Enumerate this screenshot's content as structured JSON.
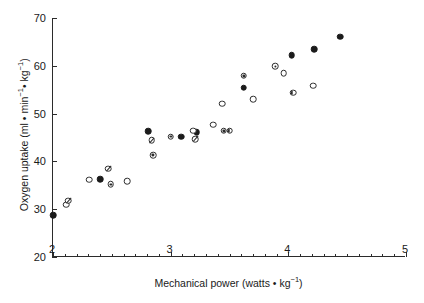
{
  "chart_data": {
    "type": "scatter",
    "title": "",
    "xlabel": "Mechanical power (watts • kg⁻¹)",
    "ylabel": "Oxygen uptake (ml • min⁻¹• kg⁻¹)",
    "xlim": [
      2,
      5
    ],
    "ylim": [
      20,
      70
    ],
    "x_major_ticks": [
      2,
      3,
      4,
      5
    ],
    "x_major_tick_labels": [
      "2",
      "3",
      "4",
      "5"
    ],
    "x_minor_tick_step": 0.1,
    "y_major_ticks": [
      20,
      30,
      40,
      50,
      60,
      70
    ],
    "y_major_tick_labels": [
      "20",
      "30",
      "40",
      "50",
      "60",
      "70"
    ],
    "grid": false,
    "legend": null,
    "marker_colors": {
      "fill": "#1b1b1b",
      "edge": "#2b2b2b",
      "background": "#ffffff"
    },
    "series": [
      {
        "name": "filled",
        "marker": "filled-circle",
        "points": [
          {
            "x": 2.0,
            "y": 28.8
          },
          {
            "x": 2.4,
            "y": 36.3
          },
          {
            "x": 2.81,
            "y": 46.3
          },
          {
            "x": 3.09,
            "y": 45.2
          },
          {
            "x": 3.22,
            "y": 46.1
          },
          {
            "x": 3.62,
            "y": 55.4
          },
          {
            "x": 4.03,
            "y": 62.2
          },
          {
            "x": 4.22,
            "y": 63.5
          },
          {
            "x": 4.44,
            "y": 66.1
          }
        ]
      },
      {
        "name": "open",
        "marker": "open-circle",
        "points": [
          {
            "x": 2.11,
            "y": 30.9
          },
          {
            "x": 2.31,
            "y": 36.2
          },
          {
            "x": 2.63,
            "y": 35.8
          },
          {
            "x": 3.19,
            "y": 46.4
          },
          {
            "x": 3.36,
            "y": 47.7
          },
          {
            "x": 3.44,
            "y": 52.1
          },
          {
            "x": 3.7,
            "y": 53.0
          },
          {
            "x": 3.96,
            "y": 58.5
          },
          {
            "x": 4.21,
            "y": 55.8
          }
        ]
      },
      {
        "name": "dotted",
        "marker": "dot-in-circle",
        "points": [
          {
            "x": 2.49,
            "y": 35.2
          },
          {
            "x": 2.85,
            "y": 41.3
          },
          {
            "x": 3.0,
            "y": 45.2
          },
          {
            "x": 3.45,
            "y": 46.4
          },
          {
            "x": 3.62,
            "y": 57.9
          },
          {
            "x": 3.89,
            "y": 59.9
          }
        ]
      },
      {
        "name": "crossed",
        "marker": "crossed-circle",
        "points": [
          {
            "x": 2.13,
            "y": 31.8
          },
          {
            "x": 2.47,
            "y": 38.5
          },
          {
            "x": 2.84,
            "y": 44.4
          },
          {
            "x": 3.21,
            "y": 44.7
          }
        ]
      },
      {
        "name": "half",
        "marker": "half-filled-circle",
        "points": [
          {
            "x": 3.5,
            "y": 46.4
          },
          {
            "x": 4.04,
            "y": 54.4
          }
        ]
      }
    ]
  }
}
